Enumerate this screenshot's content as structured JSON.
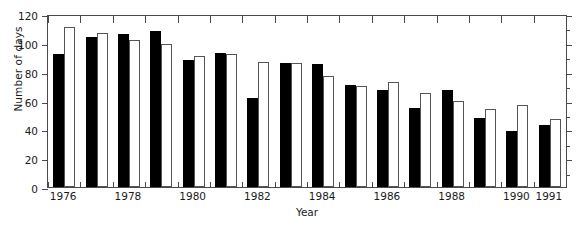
{
  "chart_data": {
    "type": "bar",
    "title": "",
    "xlabel": "Year",
    "ylabel": "Number of days",
    "ylim": [
      0,
      120
    ],
    "ytick_values": [
      0,
      20,
      40,
      60,
      80,
      100,
      120
    ],
    "ytick_labels": [
      "0",
      "20",
      "40",
      "60",
      "80",
      "100",
      "120"
    ],
    "y_minor_interval": 10,
    "grid": false,
    "legend": null,
    "legend_position": "none",
    "categories": [
      "1976",
      "1977",
      "1978",
      "1979",
      "1980",
      "1981",
      "1982",
      "1983",
      "1984",
      "1985",
      "1986",
      "1987",
      "1988",
      "1989",
      "1990",
      "1991"
    ],
    "xtick_labels_shown": [
      "1976",
      "1978",
      "1980",
      "1982",
      "1984",
      "1986",
      "1988",
      "1990",
      "1991"
    ],
    "series": [
      {
        "name": "black-bars",
        "style": "filled",
        "color": "#000000",
        "values": [
          92,
          104,
          106,
          108,
          88,
          93,
          62,
          86,
          85,
          71,
          67,
          55,
          67,
          48,
          39,
          43
        ]
      },
      {
        "name": "white-bars",
        "style": "open",
        "color": "#ffffff",
        "edge_color": "#555555",
        "values": [
          111,
          107,
          102,
          99,
          91,
          92,
          87,
          86,
          77,
          70,
          73,
          65,
          60,
          54,
          57,
          47
        ]
      }
    ]
  }
}
